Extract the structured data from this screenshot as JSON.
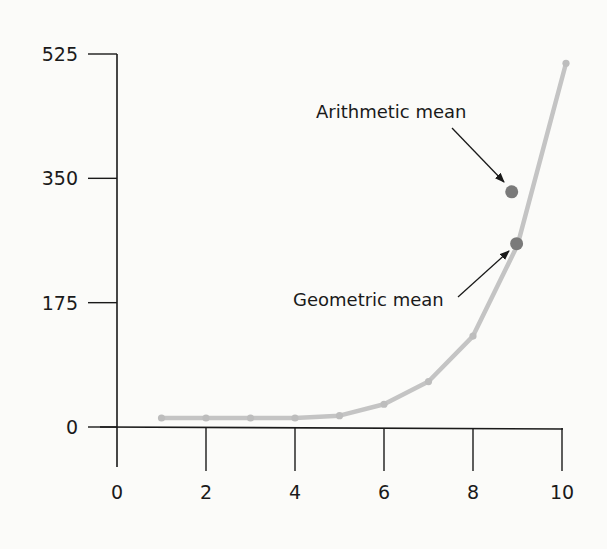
{
  "chart_data": {
    "type": "line",
    "title": "",
    "xlabel": "",
    "ylabel": "",
    "x": [
      1,
      2,
      3,
      4,
      5,
      6,
      7,
      8,
      9,
      10
    ],
    "series": [
      {
        "name": "Values",
        "values": [
          1,
          2,
          4,
          8,
          16,
          32,
          64,
          128,
          256,
          512
        ],
        "color": "#c4c4c4"
      }
    ],
    "xlim": [
      0,
      10
    ],
    "ylim": [
      0,
      525
    ],
    "xticks": [
      0,
      2,
      4,
      6,
      8,
      10
    ],
    "xtick_labels": [
      "0",
      "2",
      "4",
      "6",
      "8",
      "10"
    ],
    "yticks": [
      0,
      175,
      350,
      525
    ],
    "ytick_labels": [
      "0",
      "175",
      "350",
      "525"
    ],
    "grid": false,
    "legend": null,
    "points": [
      {
        "name": "Arithmetic mean",
        "x": 8.87,
        "y": 331,
        "color": "#7a7a7a"
      },
      {
        "name": "Geometric mean",
        "x": 8.98,
        "y": 258,
        "color": "#7a7a7a"
      }
    ],
    "annotations": [
      {
        "text": "Arithmetic mean",
        "target": "Arithmetic mean",
        "arrow": true
      },
      {
        "text": "Geometric mean",
        "target": "Geometric mean",
        "arrow": true
      }
    ]
  }
}
